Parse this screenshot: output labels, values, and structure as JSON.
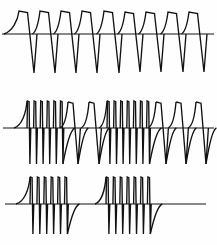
{
  "figure": {
    "background_color": "#fefefe",
    "ink_color": "#121212",
    "width": 217,
    "height": 245,
    "panel_count": 3
  },
  "chart_data": {
    "type": "line",
    "subtitle": "",
    "xlabel": "",
    "ylabel": "",
    "grid": false,
    "legend": "none",
    "axis_visible": "baseline-only",
    "xlim": [
      0,
      217
    ],
    "panels": [
      {
        "name": "panel-1-regular-pulse-train",
        "index": 0,
        "description": "Regular train of nine broad pulses, each with slow concave rise, flat top, steep fall to deep negative trough, then rapid recovery to baseline.",
        "baseline_y": 34,
        "ylim": [
          74,
          8
        ],
        "baseline_x_start": 2,
        "baseline_x_end": 214,
        "stroke_width": 1.35,
        "pulse_count": 9,
        "pulse_kind": "broad",
        "first_pulse_x": 19,
        "pulse_spacing": 21.3,
        "lead_in_rise": true,
        "lead_in_start_x": 4,
        "peak_y": 11,
        "top_tilt": 1.5,
        "top_width": 8.5,
        "trough_y": 73,
        "fall_lean": 6.5,
        "recover_width": 3.0,
        "pulses": [
          {
            "x": 19,
            "peak_y": 11,
            "trough_y": 73
          },
          {
            "x": 40,
            "peak_y": 11,
            "trough_y": 73
          },
          {
            "x": 61,
            "peak_y": 11,
            "trough_y": 73
          },
          {
            "x": 82,
            "peak_y": 11,
            "trough_y": 73
          },
          {
            "x": 104,
            "peak_y": 11,
            "trough_y": 73
          },
          {
            "x": 125,
            "peak_y": 12,
            "trough_y": 72
          },
          {
            "x": 146,
            "peak_y": 12,
            "trough_y": 72
          },
          {
            "x": 168,
            "peak_y": 12,
            "trough_y": 72
          },
          {
            "x": 189,
            "peak_y": 12,
            "trough_y": 72
          }
        ]
      },
      {
        "name": "panel-2-mixed-burst-and-single-pulses",
        "index": 1,
        "description": "Burst of six narrow spikes, two isolated broad pulses, burst of seven narrow spikes, then three isolated broad pulses.",
        "baseline_y": 128,
        "ylim": [
          166,
          100
        ],
        "baseline_x_start": 3,
        "baseline_x_end": 214,
        "stroke_width": 1.35,
        "spike_peak_y": 101,
        "spike_trough_y": 164,
        "broad_peak_y": 102,
        "broad_trough_y": 164,
        "groups": [
          {
            "kind": "burst",
            "spike_count": 6,
            "start_x": 27,
            "spacing": 6.6,
            "lead_in_start_x": 14,
            "lead_in_rise": true,
            "recovery_tail": true
          },
          {
            "kind": "single",
            "spike_count": 1,
            "start_x": 68,
            "spacing": 0,
            "lead_in_rise": true,
            "lead_in_start_x": 60,
            "recovery_tail": true
          },
          {
            "kind": "single",
            "spike_count": 1,
            "start_x": 89,
            "spacing": 0,
            "lead_in_rise": true,
            "lead_in_start_x": 81,
            "recovery_tail": true
          },
          {
            "kind": "burst",
            "spike_count": 7,
            "start_x": 107,
            "spacing": 6.6,
            "lead_in_start_x": 99,
            "lead_in_rise": true,
            "recovery_tail": true
          },
          {
            "kind": "single",
            "spike_count": 1,
            "start_x": 156,
            "spacing": 0,
            "lead_in_rise": true,
            "lead_in_start_x": 148,
            "recovery_tail": true
          },
          {
            "kind": "single",
            "spike_count": 1,
            "start_x": 176,
            "spacing": 0,
            "lead_in_rise": true,
            "lead_in_start_x": 168,
            "recovery_tail": true
          },
          {
            "kind": "single",
            "spike_count": 1,
            "start_x": 196,
            "spacing": 0,
            "lead_in_rise": true,
            "lead_in_start_x": 188,
            "recovery_tail": true
          }
        ]
      },
      {
        "name": "panel-3-two-spike-bursts",
        "index": 2,
        "description": "Two widely separated bursts of narrow spikes (six then seven) on a long quiet baseline.",
        "baseline_y": 204,
        "ylim": [
          236,
          176
        ],
        "baseline_x_start": 5,
        "baseline_x_end": 206,
        "stroke_width": 1.35,
        "spike_peak_y": 177,
        "spike_trough_y": 234,
        "groups": [
          {
            "kind": "burst",
            "spike_count": 6,
            "start_x": 30,
            "spacing": 6.9,
            "lead_in_start_x": 16,
            "lead_in_rise": true,
            "recovery_tail": true
          },
          {
            "kind": "burst",
            "spike_count": 7,
            "start_x": 106,
            "spacing": 6.9,
            "lead_in_start_x": 95,
            "lead_in_rise": true,
            "recovery_tail": true
          }
        ]
      }
    ]
  }
}
